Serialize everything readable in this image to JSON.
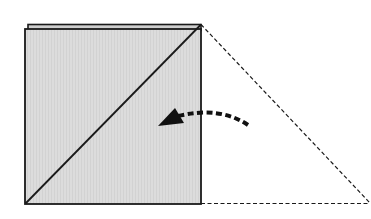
{
  "diagram": {
    "title": "Fold triangle over onto square",
    "colors": {
      "background": "#ffffff",
      "square_fill": "#dcdcdc",
      "stroke": "#1a1a1a"
    },
    "elements": {
      "folded_square": {
        "label": "Folded square (shaded)",
        "x": 25,
        "y": 28,
        "size": 176
      },
      "back_layer": {
        "label": "Back layer edge"
      },
      "diagonal": {
        "label": "Diagonal fold line"
      },
      "dashed_triangle": {
        "label": "Triangle flap (outline, to be folded)"
      },
      "fold_arrow": {
        "label": "Fold direction arrow (right to left)"
      }
    }
  }
}
